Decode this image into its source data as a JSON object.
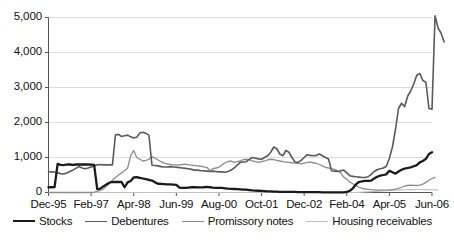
{
  "chart_data": {
    "type": "line",
    "title": "",
    "xlabel": "",
    "ylabel": "",
    "ylim": [
      0,
      5000
    ],
    "yticks": [
      0,
      1000,
      2000,
      3000,
      4000,
      5000
    ],
    "ytick_labels": [
      "0",
      "1,000",
      "2,000",
      "3,000",
      "4,000",
      "5,000"
    ],
    "grid": true,
    "legend_position": "bottom",
    "x_axis_type": "monthly",
    "x_start": "Dec-95",
    "x_end": "Jun-06",
    "xtick_labels": [
      "Dec-95",
      "Feb-97",
      "Apr-98",
      "Jun-99",
      "Aug-00",
      "Oct-01",
      "Dec-02",
      "Feb-04",
      "Apr-05",
      "Jun-06"
    ],
    "xtick_positions": [
      0,
      14,
      28,
      42,
      56,
      70,
      84,
      98,
      112,
      126
    ],
    "n_points": 127,
    "series": [
      {
        "name": "Stocks",
        "color": "#1a1a1a",
        "width": 2.3,
        "values": [
          150,
          150,
          155,
          820,
          790,
          780,
          800,
          800,
          790,
          800,
          800,
          800,
          800,
          800,
          795,
          790,
          100,
          110,
          175,
          230,
          280,
          300,
          305,
          300,
          300,
          150,
          290,
          330,
          430,
          440,
          420,
          400,
          380,
          360,
          340,
          290,
          250,
          245,
          240,
          235,
          230,
          225,
          220,
          140,
          135,
          130,
          140,
          150,
          150,
          145,
          145,
          150,
          160,
          150,
          140,
          135,
          130,
          130,
          120,
          110,
          105,
          100,
          95,
          90,
          85,
          80,
          70,
          60,
          55,
          50,
          45,
          40,
          35,
          30,
          25,
          25,
          20,
          20,
          15,
          15,
          15,
          15,
          12,
          12,
          10,
          10,
          10,
          8,
          8,
          8,
          6,
          5,
          5,
          5,
          5,
          5,
          5,
          5,
          20,
          50,
          120,
          230,
          300,
          320,
          330,
          330,
          340,
          400,
          450,
          480,
          500,
          520,
          620,
          580,
          540,
          600,
          650,
          680,
          700,
          720,
          750,
          780,
          860,
          900,
          960,
          1100,
          1150
        ]
      },
      {
        "name": "Debentures",
        "color": "#5a5a5a",
        "width": 1.6,
        "values": [
          595,
          590,
          585,
          560,
          540,
          530,
          560,
          600,
          640,
          690,
          740,
          700,
          680,
          700,
          730,
          760,
          790,
          800,
          790,
          795,
          790,
          790,
          1650,
          1660,
          1600,
          1620,
          1640,
          1590,
          1560,
          1580,
          1700,
          1720,
          1690,
          1640,
          780,
          770,
          760,
          740,
          730,
          730,
          740,
          730,
          720,
          710,
          700,
          690,
          680,
          660,
          640,
          640,
          620,
          620,
          610,
          600,
          610,
          600,
          590,
          590,
          580,
          600,
          640,
          700,
          780,
          860,
          870,
          880,
          950,
          1000,
          980,
          960,
          950,
          1000,
          1050,
          1150,
          1300,
          1250,
          1100,
          1050,
          1200,
          1150,
          1000,
          870,
          860,
          920,
          1000,
          1080,
          1060,
          1050,
          1060,
          1100,
          1050,
          1000,
          960,
          620,
          610,
          600,
          620,
          640,
          560,
          480,
          460,
          450,
          440,
          430,
          430,
          450,
          520,
          600,
          650,
          680,
          700,
          750,
          980,
          1300,
          1800,
          2400,
          2550,
          2450,
          2750,
          2900,
          3100,
          3350,
          3400,
          3200,
          3150,
          2400,
          2380,
          5050,
          4700,
          4550,
          4300
        ]
      },
      {
        "name": "Promissory notes",
        "color": "#8c8c8c",
        "width": 1.3,
        "values": [
          0,
          0,
          0,
          0,
          0,
          0,
          0,
          0,
          0,
          0,
          0,
          0,
          0,
          0,
          0,
          10,
          30,
          60,
          100,
          180,
          260,
          360,
          430,
          500,
          560,
          620,
          700,
          1050,
          1200,
          1000,
          950,
          900,
          920,
          950,
          1020,
          980,
          930,
          880,
          840,
          820,
          800,
          790,
          780,
          790,
          800,
          810,
          790,
          780,
          770,
          760,
          750,
          730,
          720,
          620,
          680,
          700,
          720,
          790,
          850,
          880,
          900,
          860,
          880,
          900,
          940,
          950,
          930,
          900,
          880,
          860,
          880,
          900,
          930,
          950,
          940,
          920,
          900,
          880,
          870,
          860,
          850,
          840,
          830,
          820,
          840,
          860,
          870,
          850,
          830,
          800,
          760,
          720,
          700,
          680,
          660,
          620,
          560,
          440,
          380,
          300,
          250,
          200,
          150,
          120,
          100,
          90,
          80,
          75,
          70,
          68,
          65,
          70,
          75,
          80,
          95,
          120,
          150,
          180,
          200,
          210,
          205,
          200,
          210,
          240,
          290,
          350,
          400,
          430
        ]
      },
      {
        "name": "Housing receivables",
        "color": "#c2c2c2",
        "width": 1.2,
        "values": [
          0,
          0,
          0,
          0,
          0,
          0,
          0,
          0,
          0,
          0,
          0,
          0,
          0,
          0,
          0,
          0,
          0,
          0,
          0,
          0,
          0,
          0,
          0,
          0,
          0,
          0,
          0,
          0,
          0,
          0,
          0,
          0,
          0,
          0,
          0,
          0,
          0,
          0,
          0,
          0,
          0,
          0,
          0,
          0,
          0,
          0,
          0,
          0,
          0,
          0,
          0,
          0,
          0,
          0,
          0,
          0,
          0,
          0,
          0,
          0,
          0,
          0,
          0,
          0,
          0,
          0,
          0,
          0,
          0,
          0,
          0,
          0,
          0,
          0,
          0,
          0,
          0,
          0,
          0,
          0,
          0,
          0,
          0,
          0,
          0,
          0,
          0,
          0,
          0,
          0,
          0,
          0,
          0,
          0,
          0,
          0,
          0,
          0,
          0,
          0,
          0,
          0,
          5,
          10,
          15,
          20,
          25,
          30,
          35,
          40,
          45,
          50,
          55,
          60,
          65,
          70,
          75,
          78,
          80,
          82,
          84,
          85,
          86,
          86,
          85,
          82,
          78,
          75,
          70
        ]
      }
    ]
  },
  "legend": {
    "items": [
      {
        "label": "Stocks",
        "color": "#1a1a1a",
        "width": 2.3
      },
      {
        "label": "Debentures",
        "color": "#5a5a5a",
        "width": 1.6
      },
      {
        "label": "Promissory notes",
        "color": "#8c8c8c",
        "width": 1.3
      },
      {
        "label": "Housing receivables",
        "color": "#c2c2c2",
        "width": 1.2
      }
    ]
  },
  "style": {
    "background": "#ffffff",
    "gridline_color": "#d9d9d9",
    "axis_color": "#555555",
    "text_color": "#111111"
  }
}
